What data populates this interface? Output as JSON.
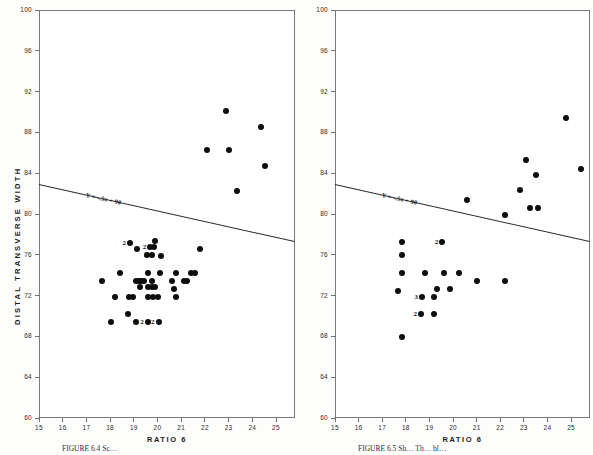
{
  "figure": {
    "background_color": "#fdfdfc",
    "point_color": "#0d0d0d",
    "line_color": "#2b2b2b",
    "axis_color": "#6f6f6f"
  },
  "panels": [
    {
      "id": "left",
      "caption": "FIGURE 6.4  Sc…",
      "chart_index": 0
    },
    {
      "id": "right",
      "caption": "FIGURE 6.5  Sh… Th… bl…",
      "chart_index": 1
    }
  ],
  "chart_data": [
    {
      "type": "scatter",
      "title": "",
      "xlabel": "RATIO 6",
      "ylabel": "DISTAL TRANSVERSE WIDTH",
      "xlim": [
        15,
        25.8
      ],
      "ylim": [
        60,
        100
      ],
      "xticks": [
        15,
        16,
        17,
        18,
        19,
        20,
        21,
        22,
        23,
        24,
        25
      ],
      "yticks": [
        60,
        64,
        68,
        72,
        76,
        80,
        84,
        88,
        92,
        96,
        100
      ],
      "grid": false,
      "legend": null,
      "annotations": [
        {
          "text": "Y = -.5x + 90",
          "x": 17.0,
          "y": 82.0,
          "kind": "regression-equation"
        }
      ],
      "regression_line": {
        "equation": "Y = -.5x + 90",
        "slope": -0.5,
        "intercept": 90,
        "x_start": 15.0,
        "y_start": 82.9,
        "x_end": 25.8,
        "y_end": 77.3
      },
      "points": [
        {
          "x": 22.9,
          "y": 90.1,
          "n": 1
        },
        {
          "x": 24.35,
          "y": 88.5,
          "n": 1
        },
        {
          "x": 22.1,
          "y": 86.3,
          "n": 1
        },
        {
          "x": 23.0,
          "y": 86.3,
          "n": 1
        },
        {
          "x": 24.55,
          "y": 84.7,
          "n": 1
        },
        {
          "x": 23.35,
          "y": 82.3,
          "n": 1
        },
        {
          "x": 19.9,
          "y": 77.4,
          "n": 1
        },
        {
          "x": 19.7,
          "y": 76.8,
          "n": 2
        },
        {
          "x": 19.85,
          "y": 76.8,
          "n": 1
        },
        {
          "x": 19.15,
          "y": 76.6,
          "n": 1
        },
        {
          "x": 18.85,
          "y": 77.2,
          "n": 2
        },
        {
          "x": 21.8,
          "y": 76.6,
          "n": 1
        },
        {
          "x": 19.55,
          "y": 76.0,
          "n": 1
        },
        {
          "x": 19.75,
          "y": 76.0,
          "n": 2
        },
        {
          "x": 20.15,
          "y": 75.9,
          "n": 1
        },
        {
          "x": 18.4,
          "y": 74.2,
          "n": 1
        },
        {
          "x": 19.6,
          "y": 74.2,
          "n": 1
        },
        {
          "x": 20.1,
          "y": 74.2,
          "n": 1
        },
        {
          "x": 20.8,
          "y": 74.2,
          "n": 1
        },
        {
          "x": 21.4,
          "y": 74.2,
          "n": 1
        },
        {
          "x": 21.6,
          "y": 74.2,
          "n": 1
        },
        {
          "x": 17.65,
          "y": 73.4,
          "n": 1
        },
        {
          "x": 19.1,
          "y": 73.4,
          "n": 1
        },
        {
          "x": 19.2,
          "y": 73.4,
          "n": 1
        },
        {
          "x": 19.3,
          "y": 73.4,
          "n": 1
        },
        {
          "x": 19.45,
          "y": 73.4,
          "n": 2
        },
        {
          "x": 19.75,
          "y": 73.4,
          "n": 1
        },
        {
          "x": 20.6,
          "y": 73.4,
          "n": 1
        },
        {
          "x": 21.1,
          "y": 73.4,
          "n": 1
        },
        {
          "x": 21.25,
          "y": 73.4,
          "n": 1
        },
        {
          "x": 19.25,
          "y": 72.8,
          "n": 1
        },
        {
          "x": 19.6,
          "y": 72.8,
          "n": 1
        },
        {
          "x": 19.75,
          "y": 72.8,
          "n": 1
        },
        {
          "x": 19.9,
          "y": 72.8,
          "n": 1
        },
        {
          "x": 20.7,
          "y": 72.6,
          "n": 1
        },
        {
          "x": 18.2,
          "y": 71.9,
          "n": 1
        },
        {
          "x": 18.8,
          "y": 71.9,
          "n": 1
        },
        {
          "x": 18.95,
          "y": 71.9,
          "n": 1
        },
        {
          "x": 19.6,
          "y": 71.9,
          "n": 1
        },
        {
          "x": 19.8,
          "y": 71.9,
          "n": 1
        },
        {
          "x": 20.0,
          "y": 71.9,
          "n": 2
        },
        {
          "x": 20.8,
          "y": 71.9,
          "n": 1
        },
        {
          "x": 18.75,
          "y": 70.2,
          "n": 1
        },
        {
          "x": 18.05,
          "y": 69.4,
          "n": 1
        },
        {
          "x": 19.1,
          "y": 69.4,
          "n": 1
        },
        {
          "x": 19.6,
          "y": 69.4,
          "n": 2
        },
        {
          "x": 20.05,
          "y": 69.4,
          "n": 2
        }
      ]
    },
    {
      "type": "scatter",
      "title": "",
      "xlabel": "RATIO 6",
      "ylabel": "DISTAL TRANSVERSE WIDTH",
      "xlim": [
        15,
        25.8
      ],
      "ylim": [
        60,
        100
      ],
      "xticks": [
        15,
        16,
        17,
        18,
        19,
        20,
        21,
        22,
        23,
        24,
        25
      ],
      "yticks": [
        60,
        64,
        68,
        72,
        76,
        80,
        84,
        88,
        92,
        96,
        100
      ],
      "grid": false,
      "legend": null,
      "annotations": [
        {
          "text": "Y = -.5x + 90",
          "x": 17.0,
          "y": 82.0,
          "kind": "regression-equation"
        }
      ],
      "regression_line": {
        "equation": "Y = -.5x + 90",
        "slope": -0.5,
        "intercept": 90,
        "x_start": 15.0,
        "y_start": 82.9,
        "x_end": 25.8,
        "y_end": 77.3
      },
      "points": [
        {
          "x": 24.8,
          "y": 89.4,
          "n": 1
        },
        {
          "x": 23.1,
          "y": 85.3,
          "n": 1
        },
        {
          "x": 23.5,
          "y": 83.8,
          "n": 1
        },
        {
          "x": 25.4,
          "y": 84.4,
          "n": 1
        },
        {
          "x": 22.85,
          "y": 82.4,
          "n": 1
        },
        {
          "x": 20.6,
          "y": 81.4,
          "n": 1
        },
        {
          "x": 23.25,
          "y": 80.6,
          "n": 1
        },
        {
          "x": 23.6,
          "y": 80.6,
          "n": 1
        },
        {
          "x": 22.2,
          "y": 79.9,
          "n": 1
        },
        {
          "x": 19.55,
          "y": 77.3,
          "n": 2
        },
        {
          "x": 17.85,
          "y": 77.3,
          "n": 1
        },
        {
          "x": 17.85,
          "y": 76.0,
          "n": 1
        },
        {
          "x": 17.85,
          "y": 74.2,
          "n": 1
        },
        {
          "x": 18.8,
          "y": 74.2,
          "n": 1
        },
        {
          "x": 19.6,
          "y": 74.2,
          "n": 1
        },
        {
          "x": 20.25,
          "y": 74.2,
          "n": 1
        },
        {
          "x": 21.0,
          "y": 73.4,
          "n": 1
        },
        {
          "x": 22.2,
          "y": 73.4,
          "n": 1
        },
        {
          "x": 17.65,
          "y": 72.5,
          "n": 1
        },
        {
          "x": 19.3,
          "y": 72.6,
          "n": 1
        },
        {
          "x": 19.85,
          "y": 72.6,
          "n": 1
        },
        {
          "x": 18.7,
          "y": 71.9,
          "n": 3
        },
        {
          "x": 19.2,
          "y": 71.9,
          "n": 1
        },
        {
          "x": 18.65,
          "y": 70.2,
          "n": 2
        },
        {
          "x": 19.2,
          "y": 70.2,
          "n": 1
        },
        {
          "x": 17.85,
          "y": 67.9,
          "n": 1
        }
      ]
    }
  ]
}
